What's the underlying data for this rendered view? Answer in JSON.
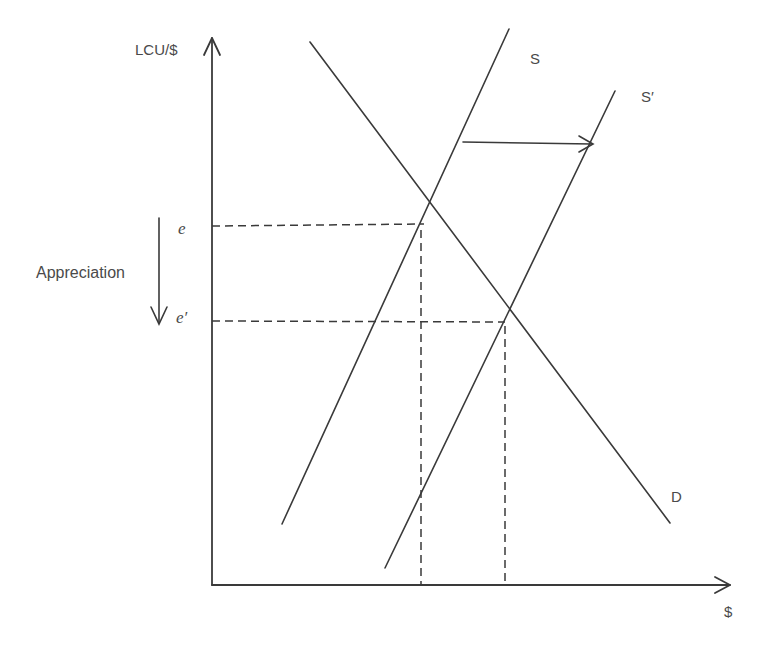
{
  "diagram": {
    "title": "",
    "axes": {
      "y_label": "LCU/$",
      "x_label": "$"
    },
    "curves": {
      "supply": {
        "label": "S"
      },
      "supply_shifted": {
        "label": "S′"
      },
      "demand": {
        "label": "D"
      }
    },
    "equilibria": {
      "initial": {
        "label": "e"
      },
      "new": {
        "label": "e′"
      }
    },
    "annotations": {
      "appreciation": "Appreciation"
    },
    "colors": {
      "line": "#3a3a3a",
      "text": "#4a4a4a",
      "background": "#ffffff"
    }
  }
}
